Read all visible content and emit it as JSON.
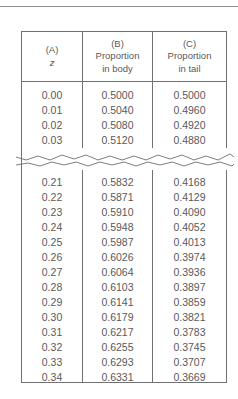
{
  "document": {
    "type": "statistical-table",
    "title": "The Unit Normal Table"
  },
  "table": {
    "columns": [
      {
        "tag": "(A)",
        "label_lines": [
          "z"
        ],
        "italic_symbol": true
      },
      {
        "tag": "(B)",
        "label_lines": [
          "Proportion",
          "in body"
        ],
        "italic_symbol": false
      },
      {
        "tag": "(C)",
        "label_lines": [
          "Proportion",
          "in tail"
        ],
        "italic_symbol": false
      }
    ],
    "rows_top": [
      {
        "z": "0.00",
        "body": "0.5000",
        "tail": "0.5000"
      },
      {
        "z": "0.01",
        "body": "0.5040",
        "tail": "0.4960"
      },
      {
        "z": "0.02",
        "body": "0.5080",
        "tail": "0.4920"
      },
      {
        "z": "0.03",
        "body": "0.5120",
        "tail": "0.4880"
      }
    ],
    "break": {
      "kind": "omitted-rows-zigzag",
      "note": "rows between z = 0.03 and z = 0.21 are not shown"
    },
    "rows_bottom": [
      {
        "z": "0.21",
        "body": "0.5832",
        "tail": "0.4168"
      },
      {
        "z": "0.22",
        "body": "0.5871",
        "tail": "0.4129"
      },
      {
        "z": "0.23",
        "body": "0.5910",
        "tail": "0.4090"
      },
      {
        "z": "0.24",
        "body": "0.5948",
        "tail": "0.4052"
      },
      {
        "z": "0.25",
        "body": "0.5987",
        "tail": "0.4013"
      },
      {
        "z": "0.26",
        "body": "0.6026",
        "tail": "0.3974"
      },
      {
        "z": "0.27",
        "body": "0.6064",
        "tail": "0.3936"
      },
      {
        "z": "0.28",
        "body": "0.6103",
        "tail": "0.3897"
      },
      {
        "z": "0.29",
        "body": "0.6141",
        "tail": "0.3859"
      },
      {
        "z": "0.30",
        "body": "0.6179",
        "tail": "0.3821"
      },
      {
        "z": "0.31",
        "body": "0.6217",
        "tail": "0.3783"
      },
      {
        "z": "0.32",
        "body": "0.6255",
        "tail": "0.3745"
      },
      {
        "z": "0.33",
        "body": "0.6293",
        "tail": "0.3707"
      },
      {
        "z": "0.34",
        "body": "0.6331",
        "tail": "0.3669"
      }
    ]
  },
  "colors": {
    "text": "#58595b",
    "rule": "#6f7174",
    "top_rule": "#8d8f92",
    "background": "#ffffff"
  }
}
